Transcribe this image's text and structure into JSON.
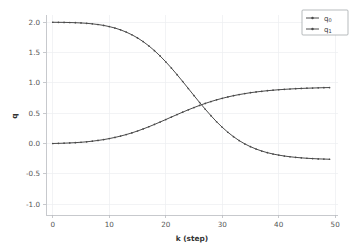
{
  "figure": {
    "background_color": "#ffffff",
    "plot_background_color": "#ffffff",
    "grid_color": "#eceef1",
    "spine_color": "#b9bcc0",
    "text_color": "#555555"
  },
  "axes": {
    "xlabel": "k (step)",
    "ylabel": "q",
    "x_ticks": [
      "0",
      "10",
      "20",
      "30",
      "40",
      "50"
    ],
    "y_ticks": [
      "2.0",
      "1.5",
      "1.0",
      "0.5",
      "0.0",
      "-0.5",
      "-1.0"
    ]
  },
  "legend": {
    "position": "upper-right",
    "entries": [
      {
        "base": "q",
        "sub": "0",
        "color": "#4a4a4a",
        "marker": "dot"
      },
      {
        "base": "q",
        "sub": "1",
        "color": "#4a4a4a",
        "marker": "dot"
      }
    ]
  },
  "chart_data": {
    "type": "line",
    "title": "",
    "xlabel": "k (step)",
    "ylabel": "q",
    "xlim": [
      -1.2,
      50.5
    ],
    "ylim": [
      -1.18,
      2.12
    ],
    "grid": true,
    "legend_position": "upper right",
    "x": [
      0,
      1,
      2,
      3,
      4,
      5,
      6,
      7,
      8,
      9,
      10,
      11,
      12,
      13,
      14,
      15,
      16,
      17,
      18,
      19,
      20,
      21,
      22,
      23,
      24,
      25,
      26,
      27,
      28,
      29,
      30,
      31,
      32,
      33,
      34,
      35,
      36,
      37,
      38,
      39,
      40,
      41,
      42,
      43,
      44,
      45,
      46,
      47,
      48,
      49
    ],
    "series": [
      {
        "name": "q0",
        "label_base": "q",
        "label_sub": "0",
        "color": "#4a4a4a",
        "marker": "dot",
        "values": [
          2.0,
          1.999,
          1.998,
          1.996,
          1.993,
          1.989,
          1.983,
          1.974,
          1.963,
          1.948,
          1.929,
          1.905,
          1.875,
          1.838,
          1.794,
          1.742,
          1.681,
          1.611,
          1.532,
          1.444,
          1.348,
          1.245,
          1.136,
          1.023,
          0.907,
          0.791,
          0.676,
          0.565,
          0.459,
          0.359,
          0.268,
          0.185,
          0.112,
          0.048,
          -0.007,
          -0.053,
          -0.092,
          -0.125,
          -0.152,
          -0.174,
          -0.192,
          -0.207,
          -0.219,
          -0.229,
          -0.237,
          -0.244,
          -0.249,
          -0.254,
          -0.257,
          -0.26
        ],
        "y_start": 2.0,
        "y_end": -1.0,
        "midpoint_k": 25,
        "midpoint_q": 0.5
      },
      {
        "name": "q1",
        "label_base": "q",
        "label_sub": "1",
        "color": "#4a4a4a",
        "marker": "dot",
        "values": [
          0.0,
          0.002,
          0.005,
          0.009,
          0.014,
          0.02,
          0.028,
          0.038,
          0.05,
          0.064,
          0.081,
          0.1,
          0.122,
          0.147,
          0.175,
          0.206,
          0.24,
          0.276,
          0.314,
          0.354,
          0.395,
          0.436,
          0.477,
          0.517,
          0.556,
          0.593,
          0.628,
          0.661,
          0.692,
          0.72,
          0.745,
          0.768,
          0.789,
          0.807,
          0.823,
          0.838,
          0.85,
          0.861,
          0.871,
          0.879,
          0.887,
          0.893,
          0.899,
          0.904,
          0.908,
          0.912,
          0.915,
          0.918,
          0.921,
          0.923
        ],
        "y_start": 0.0,
        "y_end": 1.0,
        "midpoint_k": 25,
        "midpoint_q": 0.5
      }
    ]
  },
  "geometry": {
    "plot_left": 46,
    "plot_right": 338,
    "plot_top": 15,
    "plot_bottom": 215
  }
}
